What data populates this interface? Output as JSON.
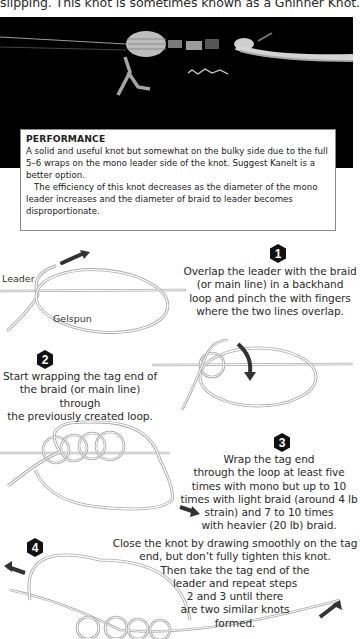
{
  "intro": {
    "partial_text": "slipping. This knot is sometimes known as a Ghinner Knot."
  },
  "photo": {
    "icon": "knot-photo",
    "background": "#000000"
  },
  "performance": {
    "title": "PERFORMANCE",
    "paragraph1": "A solid and useful knot but somewhat on the bulky side due to the full 5–6 wraps on the mono leader side of the knot. Suggest Kanelt is a better option.",
    "paragraph2": "The efficiency of this knot decreases as the diameter of the mono leader increases and the diameter of braid to leader becomes disproportionate."
  },
  "diagram_labels": {
    "leader": "Leader",
    "gelspun": "Gelspun"
  },
  "steps": [
    {
      "number": "1",
      "lines": [
        "Overlap the leader with the braid",
        "(or main line) in a backhand",
        "loop and pinch the with fingers",
        "where the two lines overlap."
      ]
    },
    {
      "number": "2",
      "lines": [
        "Start wrapping the tag end of",
        "the braid (or main line) through",
        "the previously created loop."
      ]
    },
    {
      "number": "3",
      "lines": [
        "Wrap the tag end",
        "through the loop at least five",
        "times with mono but up to 10",
        "times with light braid (around 4 lb",
        "strain) and 7 to 10 times",
        "with heavier (20 lb) braid."
      ]
    },
    {
      "number": "4",
      "lines": [
        "Close the knot by drawing smoothly on the tag",
        "end, but don’t fully tighten this knot.",
        "Then take the tag end of the",
        "leader and repeat steps",
        "2 and 3 until there",
        "are two similar knots",
        "formed."
      ]
    }
  ],
  "colors": {
    "badge": "#111111",
    "arrow": "#333333",
    "line": "#bdbdbd"
  }
}
